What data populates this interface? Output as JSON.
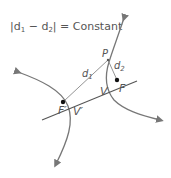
{
  "equation": {
    "left": "|d",
    "sub1": "1",
    "minus": " − d",
    "sub2": "2",
    "right": "| = Constant"
  },
  "labels": {
    "P": "P",
    "d1": "d",
    "d1_sub": "1",
    "d2": "d",
    "d2_sub": "2",
    "F": "F",
    "F_prime": "F′",
    "V": "V",
    "V_prime": "V′"
  },
  "colors": {
    "curve": "#777777",
    "line": "#555555",
    "text": "#555555",
    "point": "#111111"
  }
}
